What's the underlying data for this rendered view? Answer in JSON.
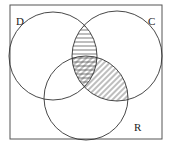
{
  "diagram": {
    "type": "venn",
    "sets": [
      {
        "label": "D",
        "cx": 53,
        "cy": 56,
        "r": 44
      },
      {
        "label": "C",
        "cx": 117,
        "cy": 56,
        "r": 45
      },
      {
        "label": "R",
        "cx": 86,
        "cy": 98,
        "r": 42
      }
    ],
    "shaded_regions": [
      {
        "region": "D ∩ C",
        "pattern": "horizontal-lines"
      },
      {
        "region": "C ∩ R",
        "pattern": "diagonal-lines"
      }
    ],
    "colors": {
      "stroke": "#333333",
      "background": "#ffffff"
    }
  },
  "labels": {
    "d": "D",
    "c": "C",
    "r": "R"
  }
}
